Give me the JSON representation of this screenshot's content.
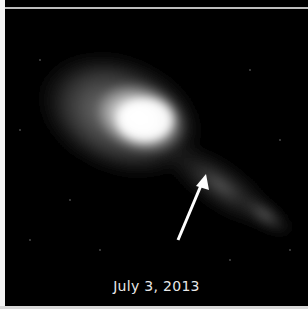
{
  "image": {
    "subject": "galaxy with tidal tail",
    "caption": "July 3, 2013",
    "annotation": "arrow-icon pointing to feature in galaxy tail",
    "colors": {
      "background": "#000000",
      "border": "#f4f4f4",
      "caption": "#e8e8e8",
      "arrow": "#ffffff"
    }
  }
}
